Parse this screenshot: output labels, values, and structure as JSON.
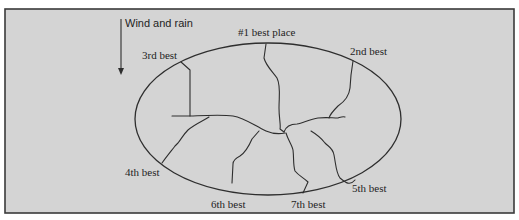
{
  "diagram": {
    "wind_label": "Wind and rain",
    "wind_direction": "down",
    "background_color": "#d4d4d4",
    "line_color": "#2e2e2e",
    "labels": {
      "best1": "#1 best place",
      "best2": "2nd best",
      "best3": "3rd best",
      "best4": "4th best",
      "best5": "5th best",
      "best6": "6th best",
      "best7": "7th best"
    }
  }
}
